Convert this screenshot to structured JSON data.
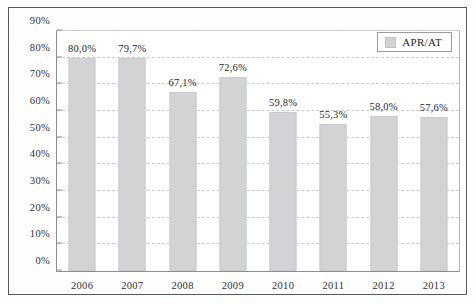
{
  "chart_data": {
    "type": "bar",
    "title": "",
    "xlabel": "",
    "ylabel": "",
    "categories": [
      "2006",
      "2007",
      "2008",
      "2009",
      "2010",
      "2011",
      "2012",
      "2013"
    ],
    "values": [
      80.0,
      79.7,
      67.1,
      72.6,
      59.8,
      55.3,
      58.0,
      57.6
    ],
    "data_labels": [
      "80,0%",
      "79,7%",
      "67,1%",
      "72,6%",
      "59,8%",
      "55,3%",
      "58,0%",
      "57,6%"
    ],
    "series": [
      {
        "name": "APR/AT",
        "values": [
          80.0,
          79.7,
          67.1,
          72.6,
          59.8,
          55.3,
          58.0,
          57.6
        ]
      }
    ],
    "ylim": [
      0,
      90
    ],
    "ytick_values": [
      0,
      10,
      20,
      30,
      40,
      50,
      60,
      70,
      80,
      90
    ],
    "ytick_labels": [
      "0%",
      "10%",
      "20%",
      "30%",
      "40%",
      "50%",
      "60%",
      "70%",
      "80%",
      "90%"
    ],
    "grid": true,
    "grid_axis": "y",
    "grid_style": "dashed",
    "legend": {
      "position": "top-right",
      "entries": [
        "APR/AT"
      ]
    },
    "colors": {
      "bar": "#d2d3d4",
      "gridline": "#c8cacc",
      "axis": "#8b8d90",
      "frame": "#55585c",
      "text": "#2e3033",
      "background": "#ffffff"
    }
  }
}
